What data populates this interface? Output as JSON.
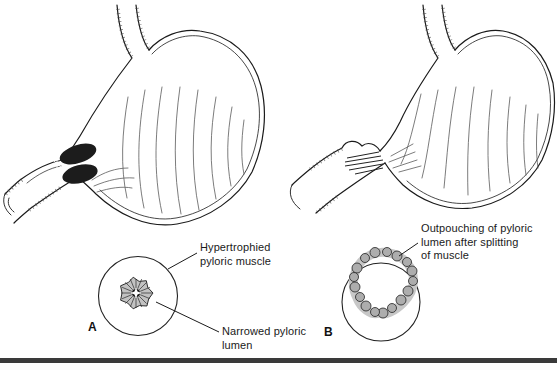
{
  "colors": {
    "ink": "#1a1a1a",
    "muscle_dark": "#1c1c1c",
    "shade_gray": "#b5b5b5",
    "bottom_bar": "#3a3a3a",
    "background": "#ffffff"
  },
  "panels": {
    "a": {
      "letter": "A",
      "illustration": "stomach-with-hypertrophied-pyloric-muscle",
      "inset": "pyloric-cross-section-narrowed-lumen"
    },
    "b": {
      "letter": "B",
      "illustration": "stomach-after-splitting-of-pyloric-muscle",
      "inset": "pyloric-cross-section-outpouched-lumen"
    }
  },
  "annotations": {
    "hypertrophied": {
      "text": "Hypertrophied pyloric muscle",
      "lines": [
        "Hypertrophied",
        "pyloric muscle"
      ]
    },
    "narrowed": {
      "text": "Narrowed pyloric lumen",
      "lines": [
        "Narrowed pyloric",
        "lumen"
      ]
    },
    "outpouching": {
      "text": "Outpouching of pyloric lumen after splitting of muscle",
      "lines": [
        "Outpouching of pyloric",
        "lumen after splitting",
        "of muscle"
      ]
    }
  }
}
